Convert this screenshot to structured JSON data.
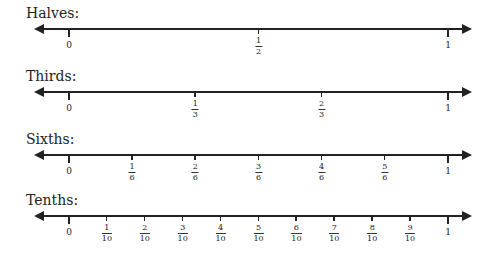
{
  "lines": [
    {
      "title": "Halves:",
      "denominator": 2,
      "start_label": "0",
      "end_label": "1",
      "fractions": [
        {
          "num": "1",
          "den": "2"
        }
      ]
    },
    {
      "title": "Thirds:",
      "denominator": 3,
      "start_label": "0",
      "end_label": "1",
      "fractions": [
        {
          "num": "1",
          "den": "3"
        },
        {
          "num": "2",
          "den": "3"
        }
      ]
    },
    {
      "title": "Sixths:",
      "denominator": 6,
      "start_label": "0",
      "end_label": "1",
      "fractions": [
        {
          "num": "1",
          "den": "6"
        },
        {
          "num": "2",
          "den": "6"
        },
        {
          "num": "3",
          "den": "6"
        },
        {
          "num": "4",
          "den": "6"
        },
        {
          "num": "5",
          "den": "6"
        }
      ]
    },
    {
      "title": "Tenths:",
      "denominator": 10,
      "start_label": "0",
      "end_label": "1",
      "fractions": [
        {
          "num": "1",
          "den": "10"
        },
        {
          "num": "2",
          "den": "10"
        },
        {
          "num": "3",
          "den": "10"
        },
        {
          "num": "4",
          "den": "10"
        },
        {
          "num": "5",
          "den": "10"
        },
        {
          "num": "6",
          "den": "10"
        },
        {
          "num": "7",
          "den": "10"
        },
        {
          "num": "8",
          "den": "10"
        },
        {
          "num": "9",
          "den": "10"
        }
      ]
    }
  ],
  "colors": {
    "ink": "#222222",
    "background": "#ffffff"
  }
}
